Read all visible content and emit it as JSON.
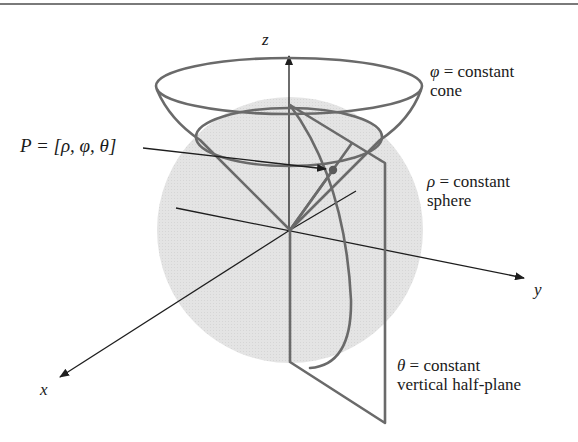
{
  "figure": {
    "axes": {
      "x": "x",
      "y": "y",
      "z": "z"
    },
    "point_label": "P = [ρ, φ, θ]",
    "surfaces": [
      {
        "symbol": "φ",
        "equation": "= constant",
        "name": "cone"
      },
      {
        "symbol": "ρ",
        "equation": "= constant",
        "name": "sphere"
      },
      {
        "symbol": "θ",
        "equation": "= constant",
        "name": "vertical half-plane"
      }
    ],
    "colors": {
      "sphere_fill": "#e2e2e2",
      "curve_stroke": "#6a6a6a",
      "axis_stroke": "#1e1e1e",
      "text": "#1a1a1a"
    }
  }
}
